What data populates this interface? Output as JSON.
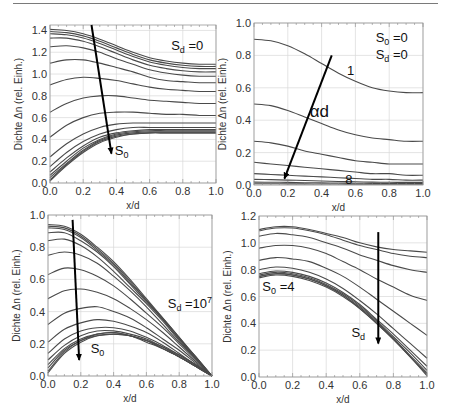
{
  "chart_data": [
    {
      "id": "top-left",
      "type": "line",
      "frame": {
        "left": 50,
        "top": 25,
        "right": 216,
        "bottom": 183
      },
      "xlabel": "x/d",
      "ylabel": "Dichte Δn (rel. Einh.)",
      "xlim": [
        0,
        1.0
      ],
      "ylim": [
        0,
        1.45
      ],
      "xticks": [
        "0.0",
        "0.2",
        "0.4",
        "0.6",
        "0.8",
        "1.0"
      ],
      "yticks": [
        {
          "v": 0.0,
          "label": "0.0"
        },
        {
          "v": 0.2,
          "label": "0.2"
        },
        {
          "v": 0.4,
          "label": "0.4"
        },
        {
          "v": 0.6,
          "label": "0.6"
        },
        {
          "v": 0.8,
          "label": "0.8"
        },
        {
          "v": 1.0,
          "label": "1.0"
        },
        {
          "v": 1.2,
          "label": "1.2"
        },
        {
          "v": 1.4,
          "label": "1.4"
        }
      ],
      "grid": true,
      "x": [
        0,
        0.1,
        0.2,
        0.3,
        0.4,
        0.5,
        0.6,
        0.7,
        0.8,
        0.9,
        1.0
      ],
      "series": [
        [
          1.41,
          1.4,
          1.37,
          1.32,
          1.26,
          1.2,
          1.15,
          1.12,
          1.1,
          1.09,
          1.09
        ],
        [
          1.39,
          1.38,
          1.35,
          1.3,
          1.24,
          1.18,
          1.13,
          1.1,
          1.08,
          1.07,
          1.07
        ],
        [
          1.37,
          1.36,
          1.33,
          1.28,
          1.22,
          1.16,
          1.11,
          1.08,
          1.06,
          1.05,
          1.05
        ],
        [
          1.33,
          1.33,
          1.3,
          1.25,
          1.19,
          1.13,
          1.08,
          1.05,
          1.03,
          1.02,
          1.02
        ],
        [
          1.25,
          1.26,
          1.24,
          1.2,
          1.14,
          1.09,
          1.04,
          1.01,
          0.99,
          0.98,
          0.98
        ],
        [
          1.1,
          1.13,
          1.13,
          1.1,
          1.06,
          1.02,
          0.97,
          0.94,
          0.93,
          0.92,
          0.92
        ],
        [
          0.9,
          0.95,
          0.97,
          0.96,
          0.94,
          0.91,
          0.88,
          0.86,
          0.85,
          0.84,
          0.84
        ],
        [
          0.65,
          0.73,
          0.78,
          0.8,
          0.8,
          0.78,
          0.76,
          0.75,
          0.74,
          0.73,
          0.73
        ],
        [
          0.42,
          0.53,
          0.6,
          0.64,
          0.65,
          0.65,
          0.64,
          0.63,
          0.63,
          0.62,
          0.62
        ],
        [
          0.24,
          0.36,
          0.45,
          0.51,
          0.54,
          0.55,
          0.55,
          0.55,
          0.55,
          0.55,
          0.55
        ],
        [
          0.15,
          0.28,
          0.38,
          0.45,
          0.49,
          0.51,
          0.51,
          0.51,
          0.51,
          0.51,
          0.51
        ],
        [
          0.1,
          0.23,
          0.34,
          0.42,
          0.46,
          0.48,
          0.49,
          0.49,
          0.49,
          0.49,
          0.49
        ],
        [
          0.07,
          0.2,
          0.32,
          0.4,
          0.45,
          0.47,
          0.48,
          0.48,
          0.48,
          0.48,
          0.48
        ],
        [
          0.05,
          0.18,
          0.3,
          0.39,
          0.44,
          0.46,
          0.47,
          0.47,
          0.47,
          0.47,
          0.47
        ],
        [
          0.03,
          0.17,
          0.29,
          0.38,
          0.43,
          0.45,
          0.46,
          0.46,
          0.46,
          0.46,
          0.46
        ],
        [
          0.02,
          0.16,
          0.28,
          0.37,
          0.42,
          0.45,
          0.46,
          0.46,
          0.46,
          0.46,
          0.46
        ]
      ],
      "arrow": {
        "from": [
          0.25,
          1.45
        ],
        "to": [
          0.37,
          0.27
        ]
      },
      "annotations": [
        {
          "text": "S",
          "sub": "d",
          "suffix": " =0",
          "x": 0.73,
          "y": 1.22,
          "cls": "anno"
        },
        {
          "text": "S",
          "sub": "0",
          "suffix": "",
          "x": 0.39,
          "y": 0.26,
          "cls": "anno"
        }
      ]
    },
    {
      "id": "top-right",
      "type": "line",
      "frame": {
        "left": 254,
        "top": 23,
        "right": 423,
        "bottom": 185
      },
      "xlabel": "x/d",
      "ylabel": "Dichte Δn (rel. Einh.)",
      "xlim": [
        0,
        1.0
      ],
      "ylim": [
        0,
        1.0
      ],
      "xticks": [
        "0.0",
        "0.2",
        "0.4",
        "0.6",
        "0.8",
        "1.0"
      ],
      "yticks": [
        {
          "v": 0.0,
          "label": "0.0"
        },
        {
          "v": 0.2,
          "label": "0.2"
        },
        {
          "v": 0.4,
          "label": "0.4"
        },
        {
          "v": 0.6,
          "label": "0.6"
        },
        {
          "v": 0.8,
          "label": "0.8"
        },
        {
          "v": 1.0,
          "label": "1.0"
        }
      ],
      "grid": true,
      "x": [
        0,
        0.1,
        0.2,
        0.3,
        0.4,
        0.5,
        0.6,
        0.7,
        0.8,
        0.9,
        1.0
      ],
      "series": [
        [
          0.9,
          0.89,
          0.86,
          0.81,
          0.75,
          0.69,
          0.64,
          0.6,
          0.58,
          0.57,
          0.57
        ],
        [
          0.5,
          0.49,
          0.46,
          0.42,
          0.38,
          0.34,
          0.31,
          0.29,
          0.28,
          0.27,
          0.27
        ],
        [
          0.27,
          0.26,
          0.24,
          0.21,
          0.19,
          0.17,
          0.15,
          0.14,
          0.13,
          0.13,
          0.13
        ],
        [
          0.14,
          0.13,
          0.12,
          0.11,
          0.1,
          0.09,
          0.08,
          0.07,
          0.07,
          0.06,
          0.06
        ],
        [
          0.07,
          0.065,
          0.06,
          0.055,
          0.05,
          0.045,
          0.04,
          0.035,
          0.035,
          0.03,
          0.03
        ],
        [
          0.035,
          0.033,
          0.03,
          0.028,
          0.025,
          0.022,
          0.02,
          0.018,
          0.017,
          0.016,
          0.016
        ],
        [
          0.018,
          0.017,
          0.016,
          0.014,
          0.013,
          0.012,
          0.011,
          0.01,
          0.009,
          0.009,
          0.009
        ],
        [
          0.008,
          0.008,
          0.007,
          0.007,
          0.006,
          0.006,
          0.005,
          0.005,
          0.005,
          0.005,
          0.005
        ]
      ],
      "arrow": {
        "from": [
          0.46,
          0.8
        ],
        "to": [
          0.18,
          0.04
        ]
      },
      "annotations": [
        {
          "text": "S",
          "sub": "0",
          "suffix": " =0",
          "x": 0.72,
          "y": 0.88,
          "cls": "anno"
        },
        {
          "text": "S",
          "sub": "d",
          "suffix": " =0",
          "x": 0.72,
          "y": 0.78,
          "cls": "anno"
        },
        {
          "text": "1",
          "sub": "",
          "suffix": "",
          "x": 0.55,
          "y": 0.68,
          "cls": "anno"
        },
        {
          "text": "αd",
          "sub": "",
          "suffix": "",
          "x": 0.33,
          "y": 0.42,
          "cls": "anno-big"
        },
        {
          "text": "8",
          "sub": "",
          "suffix": "",
          "x": 0.54,
          "y": 0.005,
          "cls": "anno"
        }
      ]
    },
    {
      "id": "bottom-left",
      "type": "line",
      "frame": {
        "left": 48,
        "top": 215,
        "right": 212,
        "bottom": 376
      },
      "xlabel": "x/d",
      "ylabel": "Dichte Δn (rel. Einh.)",
      "xlim": [
        0,
        1.0
      ],
      "ylim": [
        0,
        1.0
      ],
      "xticks": [
        "0.0",
        "0.2",
        "0.4",
        "0.6",
        "0.8",
        "1.0"
      ],
      "yticks": [
        {
          "v": 0.0,
          "label": "0.0"
        },
        {
          "v": 0.2,
          "label": "0.2"
        },
        {
          "v": 0.4,
          "label": "0.4"
        },
        {
          "v": 0.6,
          "label": "0.6"
        },
        {
          "v": 0.8,
          "label": "0.8"
        },
        {
          "v": 1.0,
          "label": "1.0"
        }
      ],
      "grid": true,
      "x": [
        0,
        0.1,
        0.2,
        0.3,
        0.4,
        0.5,
        0.6,
        0.7,
        0.8,
        0.9,
        1.0
      ],
      "series": [
        [
          0.94,
          0.93,
          0.88,
          0.8,
          0.71,
          0.6,
          0.48,
          0.36,
          0.24,
          0.12,
          0.0
        ],
        [
          0.93,
          0.92,
          0.87,
          0.79,
          0.7,
          0.59,
          0.47,
          0.36,
          0.24,
          0.12,
          0.0
        ],
        [
          0.92,
          0.91,
          0.86,
          0.78,
          0.69,
          0.58,
          0.47,
          0.35,
          0.23,
          0.12,
          0.0
        ],
        [
          0.89,
          0.89,
          0.84,
          0.77,
          0.68,
          0.57,
          0.46,
          0.35,
          0.23,
          0.11,
          0.0
        ],
        [
          0.84,
          0.85,
          0.81,
          0.74,
          0.65,
          0.55,
          0.45,
          0.34,
          0.22,
          0.11,
          0.0
        ],
        [
          0.75,
          0.77,
          0.75,
          0.7,
          0.62,
          0.53,
          0.43,
          0.32,
          0.21,
          0.11,
          0.0
        ],
        [
          0.63,
          0.67,
          0.66,
          0.62,
          0.56,
          0.48,
          0.39,
          0.3,
          0.2,
          0.1,
          0.0
        ],
        [
          0.48,
          0.53,
          0.54,
          0.52,
          0.48,
          0.42,
          0.35,
          0.27,
          0.18,
          0.09,
          0.0
        ],
        [
          0.32,
          0.39,
          0.42,
          0.43,
          0.4,
          0.36,
          0.3,
          0.23,
          0.16,
          0.08,
          0.0
        ],
        [
          0.21,
          0.29,
          0.33,
          0.35,
          0.34,
          0.31,
          0.27,
          0.21,
          0.14,
          0.07,
          0.0
        ],
        [
          0.14,
          0.23,
          0.28,
          0.3,
          0.3,
          0.28,
          0.24,
          0.19,
          0.13,
          0.07,
          0.0
        ],
        [
          0.1,
          0.19,
          0.25,
          0.28,
          0.28,
          0.26,
          0.23,
          0.18,
          0.13,
          0.07,
          0.0
        ],
        [
          0.07,
          0.17,
          0.23,
          0.26,
          0.27,
          0.25,
          0.22,
          0.18,
          0.12,
          0.06,
          0.0
        ],
        [
          0.05,
          0.16,
          0.22,
          0.26,
          0.27,
          0.25,
          0.22,
          0.17,
          0.12,
          0.06,
          0.0
        ],
        [
          0.03,
          0.15,
          0.22,
          0.25,
          0.26,
          0.25,
          0.22,
          0.17,
          0.12,
          0.06,
          0.0
        ],
        [
          0.02,
          0.14,
          0.21,
          0.25,
          0.26,
          0.25,
          0.21,
          0.17,
          0.12,
          0.06,
          0.0
        ]
      ],
      "arrow": {
        "from": [
          0.15,
          0.97
        ],
        "to": [
          0.19,
          0.1
        ]
      },
      "annotations": [
        {
          "text": "S",
          "sub": "d",
          "suffix": " =10",
          "sup": "7",
          "x": 0.73,
          "y": 0.42,
          "cls": "anno"
        },
        {
          "text": "S",
          "sub": "0",
          "suffix": "",
          "x": 0.26,
          "y": 0.14,
          "cls": "anno"
        }
      ]
    },
    {
      "id": "bottom-right",
      "type": "line",
      "frame": {
        "left": 259,
        "top": 216,
        "right": 427,
        "bottom": 377
      },
      "xlabel": "x/d",
      "ylabel": "Dichte Δn (rel. Einh.)",
      "xlim": [
        0,
        1.0
      ],
      "ylim": [
        0,
        1.2
      ],
      "xticks": [
        "0.0",
        "0.2",
        "0.4",
        "0.6",
        "0.8",
        "1.0"
      ],
      "yticks": [
        {
          "v": 0.0,
          "label": "0.0"
        },
        {
          "v": 0.2,
          "label": "0.2"
        },
        {
          "v": 0.4,
          "label": "0.4"
        },
        {
          "v": 0.6,
          "label": "0.6"
        },
        {
          "v": 0.8,
          "label": "0.8"
        },
        {
          "v": 1.0,
          "label": "1.0"
        },
        {
          "v": 1.2,
          "label": "1.2"
        }
      ],
      "grid": true,
      "x": [
        0,
        0.1,
        0.2,
        0.3,
        0.4,
        0.5,
        0.6,
        0.7,
        0.8,
        0.9,
        1.0
      ],
      "series": [
        [
          1.1,
          1.12,
          1.12,
          1.1,
          1.07,
          1.04,
          1.0,
          0.97,
          0.95,
          0.94,
          0.93
        ],
        [
          1.09,
          1.11,
          1.11,
          1.09,
          1.06,
          1.02,
          0.98,
          0.95,
          0.92,
          0.9,
          0.89
        ],
        [
          1.05,
          1.07,
          1.06,
          1.04,
          1.0,
          0.96,
          0.91,
          0.87,
          0.83,
          0.8,
          0.78
        ],
        [
          0.96,
          0.98,
          0.98,
          0.96,
          0.92,
          0.86,
          0.8,
          0.73,
          0.67,
          0.61,
          0.57
        ],
        [
          0.87,
          0.89,
          0.88,
          0.86,
          0.81,
          0.75,
          0.67,
          0.58,
          0.49,
          0.4,
          0.31
        ],
        [
          0.8,
          0.82,
          0.81,
          0.78,
          0.73,
          0.66,
          0.57,
          0.47,
          0.36,
          0.25,
          0.14
        ],
        [
          0.77,
          0.79,
          0.78,
          0.75,
          0.7,
          0.63,
          0.54,
          0.43,
          0.32,
          0.2,
          0.08
        ],
        [
          0.76,
          0.78,
          0.77,
          0.74,
          0.69,
          0.62,
          0.53,
          0.42,
          0.3,
          0.18,
          0.05
        ],
        [
          0.75,
          0.77,
          0.76,
          0.73,
          0.68,
          0.61,
          0.52,
          0.41,
          0.29,
          0.16,
          0.03
        ],
        [
          0.75,
          0.77,
          0.76,
          0.73,
          0.68,
          0.61,
          0.51,
          0.4,
          0.28,
          0.15,
          0.02
        ],
        [
          0.74,
          0.76,
          0.75,
          0.72,
          0.67,
          0.6,
          0.51,
          0.4,
          0.28,
          0.15,
          0.01
        ]
      ],
      "arrow": {
        "from": [
          0.71,
          1.08
        ],
        "to": [
          0.71,
          0.25
        ]
      },
      "annotations": [
        {
          "text": "S",
          "sub": "0",
          "suffix": " =4",
          "x": 0.02,
          "y": 0.64,
          "cls": "anno"
        },
        {
          "text": "S",
          "sub": "d",
          "suffix": "",
          "x": 0.55,
          "y": 0.3,
          "cls": "anno"
        }
      ]
    }
  ]
}
